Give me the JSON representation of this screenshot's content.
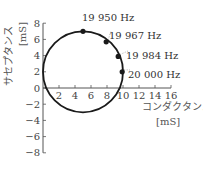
{
  "chart_data": {
    "type": "scatter",
    "title": "",
    "xlabel": "コンダクタンス",
    "xunit": "[mS]",
    "ylabel": "サセプタンス",
    "yunit": "[mS]",
    "xlim": [
      0,
      16
    ],
    "ylim": [
      -8,
      8
    ],
    "xticks": [
      2,
      4,
      6,
      8,
      10,
      12,
      14,
      16
    ],
    "yticks": [
      8,
      6,
      4,
      2,
      0,
      -2,
      -4,
      -6,
      -8
    ],
    "origin_label": "0",
    "grid": false,
    "curve": {
      "shape": "circle",
      "center": [
        5,
        2
      ],
      "radius": 5
    },
    "points": [
      {
        "x": 5.0,
        "y": 7.0,
        "label": "19 950 Hz"
      },
      {
        "x": 7.9,
        "y": 5.7,
        "label": "19 967 Hz"
      },
      {
        "x": 9.4,
        "y": 3.9,
        "label": "19 984 Hz"
      },
      {
        "x": 9.9,
        "y": 2.0,
        "label": "20 000 Hz"
      }
    ]
  },
  "colors": {
    "curve": "#1a1a1a",
    "axis": "#555555",
    "text": "#333333",
    "leader": "#888888"
  }
}
